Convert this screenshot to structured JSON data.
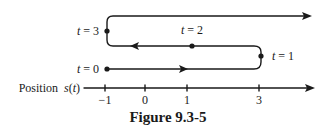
{
  "figure": {
    "caption": "Figure 9.3-5",
    "axis_label_word": "Position",
    "axis_label_func": "s(t)",
    "ticks": [
      {
        "value": "−1",
        "x": 105
      },
      {
        "value": "0",
        "x": 145
      },
      {
        "value": "1",
        "x": 187
      },
      {
        "value": "3",
        "x": 259
      }
    ],
    "points": [
      {
        "label": "t = 0",
        "position": -1
      },
      {
        "label": "t = 1",
        "position": 3
      },
      {
        "label": "t = 2",
        "position": 1
      },
      {
        "label": "t = 3",
        "position": -1
      }
    ],
    "colors": {
      "ink": "#1a1a1a",
      "background": "#ffffff"
    }
  }
}
